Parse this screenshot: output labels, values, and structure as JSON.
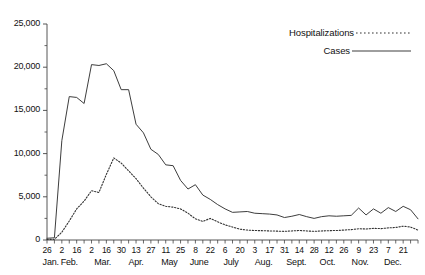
{
  "chart_data": {
    "type": "line",
    "title": "",
    "xlabel": "",
    "ylabel": "",
    "ylim": [
      0,
      25000
    ],
    "ytick_labels": [
      "0",
      "5,000",
      "10,000",
      "15,000",
      "20,000",
      "25,000"
    ],
    "ytick_values": [
      0,
      5000,
      10000,
      15000,
      20000,
      25000
    ],
    "yminor_interval": 2500,
    "grid": false,
    "legend_position": "top-right",
    "legend": [
      {
        "name": "Hospitalizations",
        "style": "dotted"
      },
      {
        "name": "Cases",
        "style": "solid"
      }
    ],
    "x_tick_labels": [
      "26",
      "2",
      "16",
      "2",
      "16",
      "30",
      "13",
      "27",
      "11",
      "25",
      "8",
      "22",
      "6",
      "20",
      "3",
      "17",
      "31",
      "14",
      "28",
      "12",
      "26",
      "9",
      "23",
      "7",
      "21"
    ],
    "x_month_labels": [
      "Jan.",
      "Feb.",
      "Mar.",
      "Apr.",
      "May",
      "June",
      "July",
      "Aug.",
      "Sept.",
      "Oct.",
      "Nov.",
      "Dec."
    ],
    "series": [
      {
        "name": "Cases",
        "style": "solid",
        "values": [
          200,
          260,
          11500,
          16600,
          16500,
          15800,
          20300,
          20200,
          20400,
          19600,
          17400,
          17400,
          13400,
          12400,
          10500,
          9900,
          8700,
          8600,
          6900,
          5900,
          6400,
          5200,
          4700,
          4100,
          3600,
          3200,
          3250,
          3300,
          3100,
          3050,
          3000,
          2900,
          2600,
          2750,
          2950,
          2700,
          2500,
          2700,
          2800,
          2750,
          2800,
          2850,
          3700,
          2900,
          3600,
          3100,
          3750,
          3300,
          3900,
          3500,
          2450
        ]
      },
      {
        "name": "Hospitalizations",
        "style": "dotted",
        "values": [
          60,
          80,
          900,
          2200,
          3600,
          4500,
          5700,
          5500,
          7600,
          9500,
          8900,
          8000,
          7100,
          6000,
          5000,
          4200,
          3900,
          3800,
          3600,
          3100,
          2450,
          2150,
          2500,
          2100,
          1750,
          1500,
          1250,
          1150,
          1100,
          1080,
          1050,
          1030,
          1000,
          1050,
          1100,
          1050,
          1000,
          1050,
          1080,
          1100,
          1150,
          1200,
          1300,
          1280,
          1350,
          1320,
          1400,
          1450,
          1600,
          1500,
          1150
        ]
      }
    ]
  },
  "legend": {
    "hospitalizations_label": "Hospitalizations",
    "cases_label": "Cases"
  }
}
